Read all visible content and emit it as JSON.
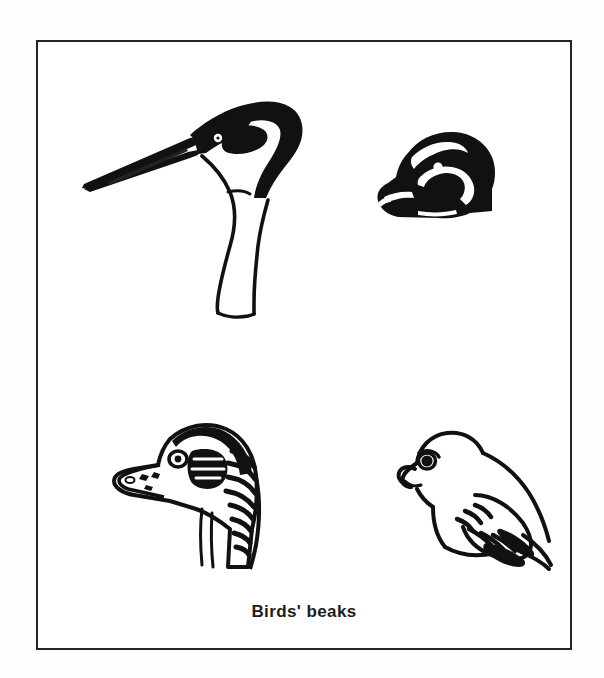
{
  "page": {
    "background_color": "#fefefe",
    "plate_background_color": "#ffffff",
    "ink_color": "#1c1c1c",
    "border_color": "#252525"
  },
  "plate": {
    "caption": "Birds' beaks",
    "figure_count": 4,
    "layout": "2x2 grid of bird head drawings above a centered caption",
    "style": "black-and-white pen-and-ink line drawings"
  },
  "figures": [
    {
      "id": "heron",
      "position": "top-left",
      "label": "heron with long dagger beak",
      "beak_type": "long pointed spear-like beak",
      "description": "Heron or stork head in profile facing left, dark crown and long slender beak, pale curving S-neck"
    },
    {
      "id": "dark-duck",
      "position": "top-right",
      "label": "dark duck head with broad flat bill",
      "beak_type": "broad flattened dabbling bill",
      "description": "Solid black duck head in profile facing left, white eye dot and white facial stripe markings"
    },
    {
      "id": "goose-head",
      "position": "bottom-left",
      "label": "duck head with spatulate bill",
      "beak_type": "wide spatulate bill",
      "description": "Duck or goose head in profile facing left with hatched striped shading over head and neck"
    },
    {
      "id": "perching-bird",
      "position": "bottom-right",
      "label": "small perching bird with short hooked beak",
      "beak_type": "short stout hooked seed-cracking beak",
      "description": "Whole small perching bird facing left, head lowered, detailed layered wing feathers and long tail"
    }
  ]
}
